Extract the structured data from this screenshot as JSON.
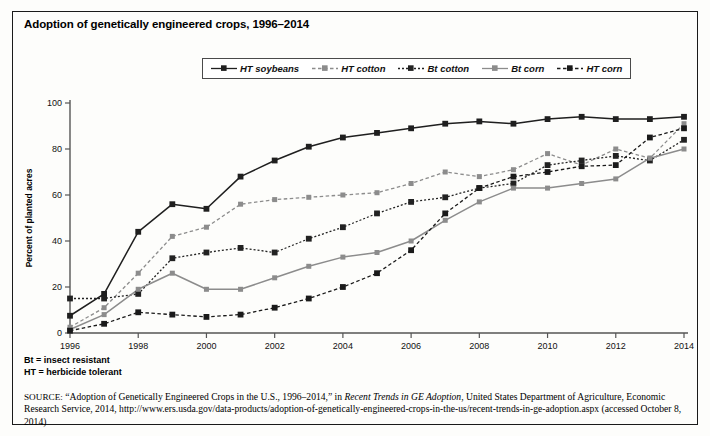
{
  "title": "Adoption of genetically engineered crops, 1996–2014",
  "footnotes": [
    "Bt = insect resistant",
    "HT = herbicide tolerant"
  ],
  "source": {
    "label": "SOURCE:",
    "text_before_italic": " “Adoption of Genetically Engineered Crops in the U.S., 1996–2014,” in ",
    "italic_title": "Recent Trends in GE Adoption",
    "text_after_italic": ", United States Department of Agriculture, Economic Research Service, 2014, http://www.ers.usda.gov/data-products/adoption-of-genetically-engineered-crops-in-the-us/recent-trends-in-ge-adoption.aspx (accessed October 8, 2014)"
  },
  "colors": {
    "soybeans": "#1f1f1f",
    "ht_cotton": "#8c8c8c",
    "bt_cotton": "#222222",
    "bt_corn": "#8c8c8c",
    "ht_corn": "#1a1a1a",
    "axis": "#555555",
    "frame": "#1a1a1a"
  },
  "chart_data": {
    "type": "line",
    "title": "Adoption of genetically engineered crops, 1996–2014",
    "xlabel": "",
    "ylabel": "Percent of planted acres",
    "xlim": [
      1996,
      2014
    ],
    "ylim": [
      0,
      100
    ],
    "ytick_labels": [
      "0",
      "20",
      "40",
      "60",
      "80",
      "100"
    ],
    "yticks": [
      0,
      20,
      40,
      60,
      80,
      100
    ],
    "xtick_labels": [
      "1996",
      "1998",
      "2000",
      "2002",
      "2004",
      "2006",
      "2008",
      "2010",
      "2012",
      "2014"
    ],
    "xticks": [
      1996,
      1998,
      2000,
      2002,
      2004,
      2006,
      2008,
      2010,
      2012,
      2014
    ],
    "grid": false,
    "legend_position": "top-center",
    "x": [
      1996,
      1997,
      1998,
      1999,
      2000,
      2001,
      2002,
      2003,
      2004,
      2005,
      2006,
      2007,
      2008,
      2009,
      2010,
      2011,
      2012,
      2013,
      2014
    ],
    "series": [
      {
        "name": "HT soybeans",
        "style": "solid",
        "color": "#1f1f1f",
        "values": [
          7.5,
          17,
          44,
          56,
          54,
          68,
          75,
          81,
          85,
          87,
          89,
          91,
          92,
          91,
          93,
          94,
          93,
          93,
          94
        ]
      },
      {
        "name": "HT cotton",
        "style": "dashed",
        "color": "#8c8c8c",
        "values": [
          2.5,
          11,
          26,
          42,
          46,
          56,
          58,
          59,
          60,
          61,
          65,
          70,
          68,
          71,
          78,
          73,
          80,
          76,
          91
        ]
      },
      {
        "name": "Bt cotton",
        "style": "dotted",
        "color": "#222222",
        "values": [
          15,
          15,
          17,
          32.5,
          35,
          37,
          35,
          41,
          46,
          52,
          57,
          59,
          63,
          65,
          73,
          75,
          77,
          75,
          84
        ]
      },
      {
        "name": "Bt corn",
        "style": "solid",
        "color": "#8c8c8c",
        "values": [
          1.5,
          8,
          19,
          26,
          19,
          19,
          24,
          29,
          33,
          35,
          40,
          49,
          57,
          63,
          63,
          65,
          67,
          76,
          80
        ]
      },
      {
        "name": "HT corn",
        "style": "dashed",
        "color": "#1a1a1a",
        "values": [
          1,
          4,
          9,
          8,
          7,
          8,
          11,
          15,
          20,
          26,
          36,
          52,
          63,
          68,
          70,
          72.5,
          73,
          85,
          89
        ]
      }
    ]
  }
}
